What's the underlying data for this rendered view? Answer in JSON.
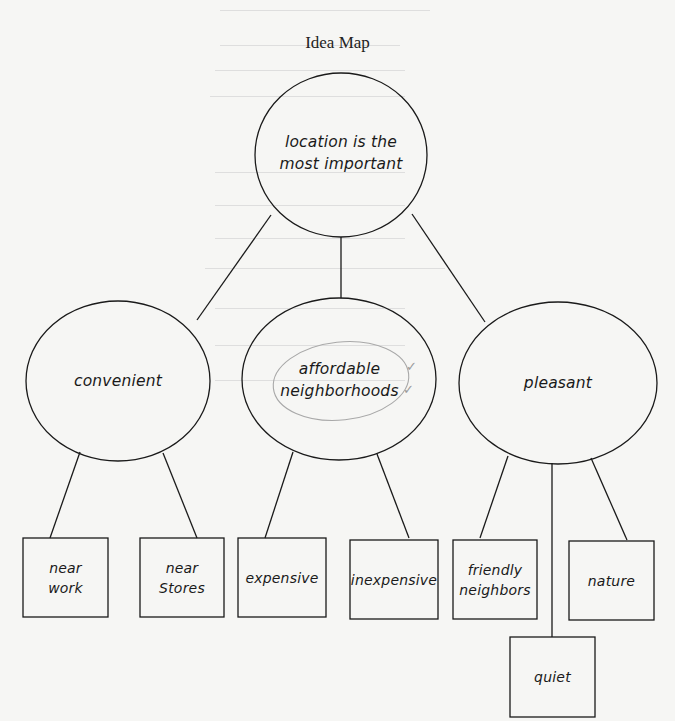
{
  "title": "Idea Map",
  "colors": {
    "ink": "#1a1a1a",
    "pencil_annotation": "#9a9a9a",
    "paper": "#f6f6f4",
    "bleed_through": "#d8d8d6"
  },
  "root": {
    "lines": [
      "location is the",
      "most important"
    ]
  },
  "branches": [
    {
      "label": "convenient",
      "children": [
        {
          "lines": [
            "near",
            "work"
          ]
        },
        {
          "lines": [
            "near",
            "Stores"
          ]
        }
      ]
    },
    {
      "label": "affordable neighborhoods",
      "lines": [
        "affordable",
        "neighborhoods"
      ],
      "annotation": {
        "circled": true,
        "checkmarks": [
          "✓",
          "✓"
        ]
      },
      "children": [
        {
          "lines": [
            "expensive"
          ]
        },
        {
          "lines": [
            "inexpensive"
          ]
        }
      ]
    },
    {
      "label": "pleasant",
      "children": [
        {
          "lines": [
            "friendly",
            "neighbors"
          ]
        },
        {
          "lines": [
            "quiet"
          ]
        },
        {
          "lines": [
            "nature"
          ]
        }
      ]
    }
  ]
}
